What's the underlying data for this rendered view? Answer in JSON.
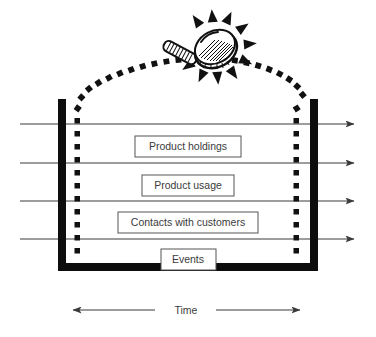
{
  "diagram": {
    "container": {
      "name": "data-container",
      "walls_color": "#0d0d0d",
      "dotted_border_color": "#111111"
    },
    "layers": [
      {
        "id": "product-holdings",
        "label": "Product holdings",
        "x": 135,
        "y": 136,
        "width": 106,
        "height": 21
      },
      {
        "id": "product-usage",
        "label": "Product usage",
        "x": 142,
        "y": 175,
        "width": 92,
        "height": 21
      },
      {
        "id": "contacts-with-customers",
        "label": "Contacts with customers",
        "x": 118,
        "y": 212,
        "width": 140,
        "height": 21
      },
      {
        "id": "events",
        "label": "Events",
        "x": 161,
        "y": 249,
        "width": 55,
        "height": 21
      }
    ],
    "flow_arrows": [
      {
        "id": "flow-1",
        "y": 124
      },
      {
        "id": "flow-2",
        "y": 163
      },
      {
        "id": "flow-3",
        "y": 201
      },
      {
        "id": "flow-4",
        "y": 239
      }
    ],
    "time_axis": {
      "label": "Time",
      "label_x": 188,
      "label_y": 311,
      "left_arrow": {
        "from_x": 155,
        "to_x": 73,
        "y": 310
      },
      "right_arrow": {
        "from_x": 216,
        "to_x": 300,
        "y": 310
      }
    },
    "magnifier": {
      "name": "magnifying-glass",
      "lens_cx": 215,
      "lens_cy": 48,
      "rays_count": 12,
      "description": "tilted magnifying glass with ribbed handle and radiating sparkle rays"
    },
    "colors": {
      "ink": "#111111",
      "line": "#3a3a3a",
      "box_stroke": "#555555",
      "text": "#3b3b3b",
      "background": "#ffffff"
    }
  }
}
